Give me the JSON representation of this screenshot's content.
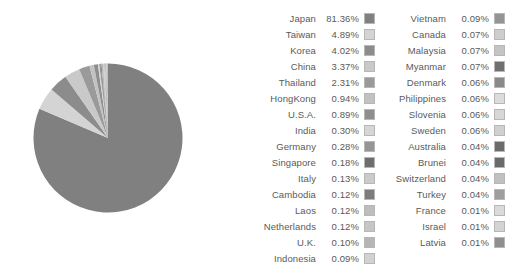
{
  "chart_data": {
    "type": "pie",
    "title": "",
    "subtitle": "",
    "xlabel": "",
    "ylabel": "",
    "unit": "%",
    "legend_position": "right",
    "grid": false,
    "start_angle_deg": 0,
    "direction": "clockwise",
    "background_color": "#ffffff",
    "text_color": "#5a5a5a",
    "swatch_border_color": "#b7b7b7",
    "categories": [
      "Japan",
      "Taiwan",
      "Korea",
      "China",
      "Thailand",
      "HongKong",
      "U.S.A.",
      "India",
      "Germany",
      "Singapore",
      "Italy",
      "Cambodia",
      "Laos",
      "Netherlands",
      "U.K.",
      "Indonesia",
      "Vietnam",
      "Canada",
      "Malaysia",
      "Myanmar",
      "Denmark",
      "Philippines",
      "Slovenia",
      "Sweden",
      "Australia",
      "Brunei",
      "Switzerland",
      "Turkey",
      "France",
      "Israel",
      "Latvia"
    ],
    "values": [
      81.36,
      4.89,
      4.02,
      3.37,
      2.31,
      0.94,
      0.89,
      0.3,
      0.28,
      0.18,
      0.13,
      0.12,
      0.12,
      0.12,
      0.1,
      0.09,
      0.09,
      0.07,
      0.07,
      0.07,
      0.06,
      0.06,
      0.06,
      0.06,
      0.04,
      0.04,
      0.04,
      0.04,
      0.01,
      0.01,
      0.01
    ],
    "value_labels": [
      "81.36%",
      "4.89%",
      "4.02%",
      "3.37%",
      "2.31%",
      "0.94%",
      "0.89%",
      "0.30%",
      "0.28%",
      "0.18%",
      "0.13%",
      "0.12%",
      "0.12%",
      "0.12%",
      "0.10%",
      "0.09%",
      "0.09%",
      "0.07%",
      "0.07%",
      "0.07%",
      "0.06%",
      "0.06%",
      "0.06%",
      "0.06%",
      "0.04%",
      "0.04%",
      "0.04%",
      "0.04%",
      "0.01%",
      "0.01%",
      "0.01%"
    ],
    "colors": [
      "#808080",
      "#d4d4d4",
      "#8c8c8c",
      "#c9c9c9",
      "#9a9a9a",
      "#c2c2c2",
      "#8e8e8e",
      "#d6d6d6",
      "#959595",
      "#6e6e6e",
      "#cbcbcb",
      "#7c7c7c",
      "#bdbdbd",
      "#c6c6c6",
      "#b5b5b5",
      "#d2d2d2",
      "#949494",
      "#cdcdcd",
      "#c4c4c4",
      "#6f6f6f",
      "#8a8a8a",
      "#dcdcdc",
      "#d7d7d7",
      "#d0d0d0",
      "#6b6b6b",
      "#6a6a6a",
      "#c0c0c0",
      "#9e9e9e",
      "#dadada",
      "#d3d3d3",
      "#8f8f8f"
    ]
  },
  "legend": {
    "columns": [
      {
        "name": "legend-column-1",
        "rows": [
          {
            "label": "Japan",
            "value": "81.36%",
            "color": "#808080"
          },
          {
            "label": "Taiwan",
            "value": "4.89%",
            "color": "#d4d4d4"
          },
          {
            "label": "Korea",
            "value": "4.02%",
            "color": "#8c8c8c"
          },
          {
            "label": "China",
            "value": "3.37%",
            "color": "#c9c9c9"
          },
          {
            "label": "Thailand",
            "value": "2.31%",
            "color": "#9a9a9a"
          },
          {
            "label": "HongKong",
            "value": "0.94%",
            "color": "#c2c2c2"
          },
          {
            "label": "U.S.A.",
            "value": "0.89%",
            "color": "#8e8e8e"
          },
          {
            "label": "India",
            "value": "0.30%",
            "color": "#d6d6d6"
          },
          {
            "label": "Germany",
            "value": "0.28%",
            "color": "#959595"
          },
          {
            "label": "Singapore",
            "value": "0.18%",
            "color": "#6e6e6e"
          },
          {
            "label": "Italy",
            "value": "0.13%",
            "color": "#cbcbcb"
          },
          {
            "label": "Cambodia",
            "value": "0.12%",
            "color": "#7c7c7c"
          },
          {
            "label": "Laos",
            "value": "0.12%",
            "color": "#bdbdbd"
          },
          {
            "label": "Netherlands",
            "value": "0.12%",
            "color": "#c6c6c6"
          },
          {
            "label": "U.K.",
            "value": "0.10%",
            "color": "#b5b5b5"
          },
          {
            "label": "Indonesia",
            "value": "0.09%",
            "color": "#d2d2d2"
          }
        ]
      },
      {
        "name": "legend-column-2",
        "rows": [
          {
            "label": "Vietnam",
            "value": "0.09%",
            "color": "#949494"
          },
          {
            "label": "Canada",
            "value": "0.07%",
            "color": "#cdcdcd"
          },
          {
            "label": "Malaysia",
            "value": "0.07%",
            "color": "#c4c4c4"
          },
          {
            "label": "Myanmar",
            "value": "0.07%",
            "color": "#6f6f6f"
          },
          {
            "label": "Denmark",
            "value": "0.06%",
            "color": "#8a8a8a"
          },
          {
            "label": "Philippines",
            "value": "0.06%",
            "color": "#dcdcdc"
          },
          {
            "label": "Slovenia",
            "value": "0.06%",
            "color": "#d7d7d7"
          },
          {
            "label": "Sweden",
            "value": "0.06%",
            "color": "#d0d0d0"
          },
          {
            "label": "Australia",
            "value": "0.04%",
            "color": "#6b6b6b"
          },
          {
            "label": "Brunei",
            "value": "0.04%",
            "color": "#6a6a6a"
          },
          {
            "label": "Switzerland",
            "value": "0.04%",
            "color": "#c0c0c0"
          },
          {
            "label": "Turkey",
            "value": "0.04%",
            "color": "#9e9e9e"
          },
          {
            "label": "France",
            "value": "0.01%",
            "color": "#dadada"
          },
          {
            "label": "Israel",
            "value": "0.01%",
            "color": "#d3d3d3"
          },
          {
            "label": "Latvia",
            "value": "0.01%",
            "color": "#8f8f8f"
          }
        ]
      }
    ]
  }
}
